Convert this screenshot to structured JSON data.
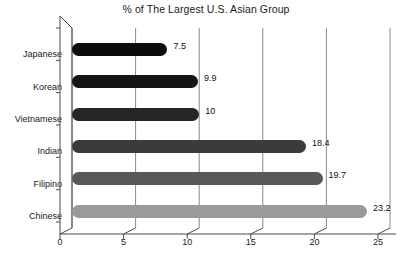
{
  "chart_data": {
    "type": "bar",
    "orientation": "horizontal",
    "title": "% of The Largest U.S. Asian Group",
    "xlabel": "",
    "ylabel": "",
    "xlim": [
      0,
      25
    ],
    "xticks": [
      0,
      5,
      10,
      15,
      20,
      25
    ],
    "xtick_labels": [
      "0",
      "5",
      "10",
      "15",
      "20",
      "25"
    ],
    "grid": true,
    "grid_axis": "x",
    "legend": false,
    "data_labels": true,
    "categories": [
      "Japanese",
      "Korean",
      "Vietnamese",
      "Indian",
      "Filipino",
      "Chinese"
    ],
    "values": [
      7.5,
      9.9,
      10,
      18.4,
      19.7,
      23.2
    ],
    "value_labels": [
      "7.5",
      "9.9",
      "10",
      "18.4",
      "19.7",
      "23.2"
    ],
    "bar_colors": [
      "#0c0c0c",
      "#151515",
      "#262626",
      "#3b3b3b",
      "#585858",
      "#9a9a9a"
    ],
    "background_color": "#ffffff",
    "axis_color": "#4a4a4a",
    "grid_color": "#888888",
    "text_color": "#1a1a1a"
  }
}
